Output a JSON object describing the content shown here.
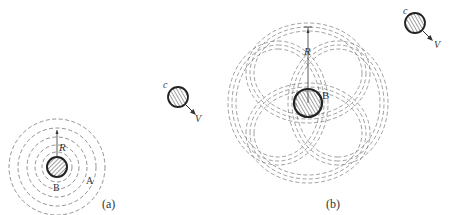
{
  "panels": [
    {
      "id": "a",
      "caption": "(a)",
      "central_body_label": "B",
      "orbit_point_label": "A",
      "radius_label": "R",
      "description": "Concentric dashed circular orbits around central body B"
    },
    {
      "id": "b",
      "caption": "(b)",
      "central_body_label": "B",
      "radius_label": "R",
      "description": "Rosette pattern of dashed precessing orbits around central body B"
    }
  ],
  "moving_bodies": [
    {
      "label": "c",
      "velocity_label": "V"
    },
    {
      "label": "c",
      "velocity_label": "V"
    }
  ],
  "colors": {
    "stroke": "#333333",
    "dashed": "#666666",
    "background": "#ffffff"
  }
}
